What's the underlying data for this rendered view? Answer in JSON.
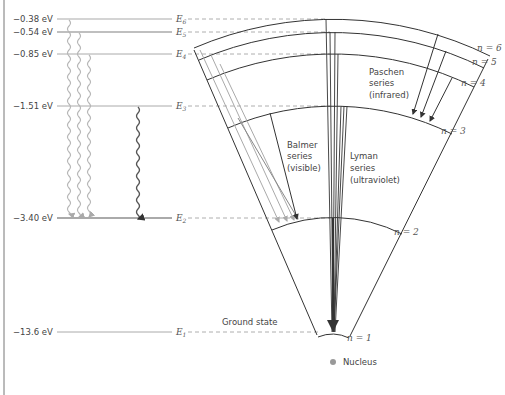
{
  "header": {
    "caption_cut": "Series transitions"
  },
  "levels": [
    {
      "n": 6,
      "energy": "−0.38 eV",
      "e_label": "E",
      "e_sub": "6",
      "y": 19
    },
    {
      "n": 5,
      "energy": "−0.54 eV",
      "e_label": "E",
      "e_sub": "5",
      "y": 32
    },
    {
      "n": 4,
      "energy": "−0.85 eV",
      "e_label": "E",
      "e_sub": "4",
      "y": 54
    },
    {
      "n": 3,
      "energy": "−1.51 eV",
      "e_label": "E",
      "e_sub": "3",
      "y": 106
    },
    {
      "n": 2,
      "energy": "−3.40 eV",
      "e_label": "E",
      "e_sub": "2",
      "y": 218
    },
    {
      "n": 1,
      "energy": "−13.6 eV",
      "e_label": "E",
      "e_sub": "1",
      "y": 332
    }
  ],
  "orbits": [
    {
      "label": "n = 6"
    },
    {
      "label": "n = 5"
    },
    {
      "label": "n = 4"
    },
    {
      "label": "n = 3"
    },
    {
      "label": "n = 2"
    },
    {
      "label": "n = 1"
    }
  ],
  "series": {
    "paschen": {
      "line1": "Paschen",
      "line2": "series",
      "line3": "(infrared)"
    },
    "balmer": {
      "line1": "Balmer",
      "line2": "series",
      "line3": "(visible)"
    },
    "lyman": {
      "line1": "Lyman",
      "line2": "series",
      "line3": "(ultraviolet)"
    }
  },
  "ground_state": "Ground state",
  "nucleus": "Nucleus",
  "colors": {
    "line": "#333333",
    "level": "#a8a8a8",
    "dash": "#9a9a9a",
    "light_arrow": "#b8b8b8",
    "nucleus": "#999999",
    "text": "#444444"
  }
}
